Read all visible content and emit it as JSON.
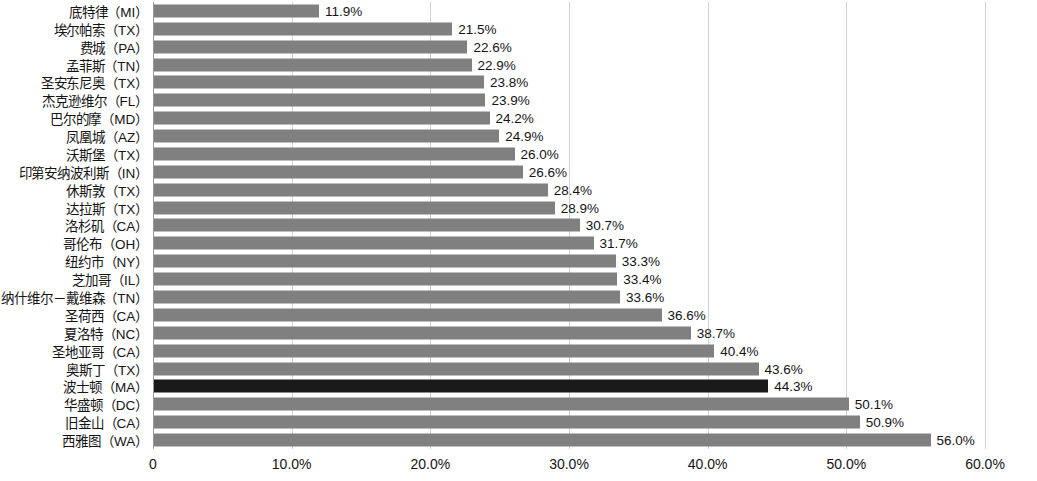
{
  "chart_data": {
    "type": "bar",
    "orientation": "horizontal",
    "title": "",
    "subtitle": "",
    "xlabel": "",
    "ylabel": "",
    "xlim": [
      0,
      60
    ],
    "grid": true,
    "legend": null,
    "xticks": [
      "0",
      "10.0%",
      "20.0%",
      "30.0%",
      "40.0%",
      "50.0%",
      "60.0%"
    ],
    "xtick_values": [
      0,
      10,
      20,
      30,
      40,
      50,
      60
    ],
    "bar_color": "#808080",
    "highlight_color": "#1a1a1a",
    "highlight_category": "波士顿（MA）",
    "categories": [
      "底特律（MI）",
      "埃尔帕索（TX）",
      "费城（PA）",
      "孟菲斯（TN）",
      "圣安东尼奥（TX）",
      "杰克逊维尔（FL）",
      "巴尔的摩（MD）",
      "凤凰城（AZ）",
      "沃斯堡（TX）",
      "印第安纳波利斯（IN）",
      "休斯敦（TX）",
      "达拉斯（TX）",
      "洛杉矶（CA）",
      "哥伦布（OH）",
      "纽约市（NY）",
      "芝加哥（IL）",
      "纳什维尔－戴维森（TN）",
      "圣荷西（CA）",
      "夏洛特（NC）",
      "圣地亚哥（CA）",
      "奥斯丁（TX）",
      "波士顿（MA）",
      "华盛顿（DC）",
      "旧金山（CA）",
      "西雅图（WA）"
    ],
    "values": [
      11.9,
      21.5,
      22.6,
      22.9,
      23.8,
      23.9,
      24.2,
      24.9,
      26.0,
      26.6,
      28.4,
      28.9,
      30.7,
      31.7,
      33.3,
      33.4,
      33.6,
      36.6,
      38.7,
      40.4,
      43.6,
      44.3,
      50.1,
      50.9,
      56.0
    ],
    "value_labels": [
      "11.9%",
      "21.5%",
      "22.6%",
      "22.9%",
      "23.8%",
      "23.9%",
      "24.2%",
      "24.9%",
      "26.0%",
      "26.6%",
      "28.4%",
      "28.9%",
      "30.7%",
      "31.7%",
      "33.3%",
      "33.4%",
      "33.6%",
      "36.6%",
      "38.7%",
      "40.4%",
      "43.6%",
      "44.3%",
      "50.1%",
      "50.9%",
      "56.0%"
    ]
  }
}
